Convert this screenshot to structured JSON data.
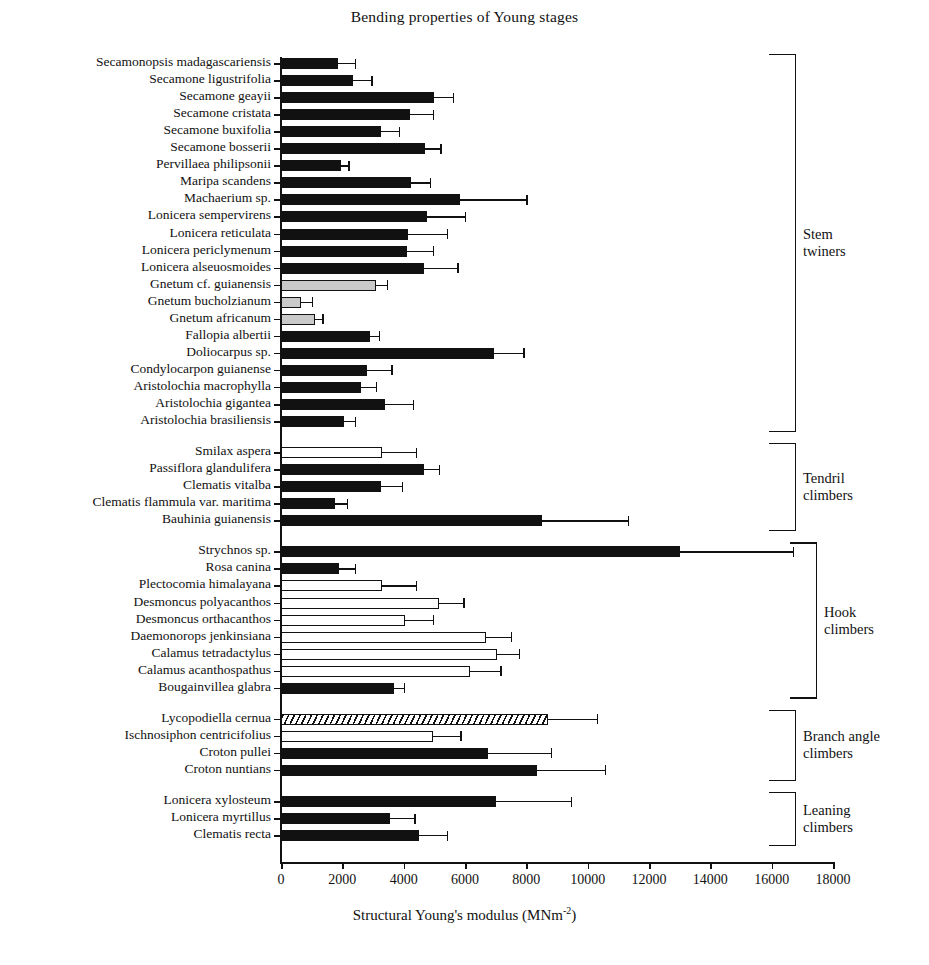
{
  "title": "Bending properties of Young stages",
  "axis": {
    "x_label_main": "Structural Young's modulus (MNm",
    "x_label_sup": "-2",
    "x_label_end": ")",
    "x_ticks": [
      "0",
      "2000",
      "4000",
      "6000",
      "8000",
      "10000",
      "12000",
      "14000",
      "16000",
      "18000"
    ]
  },
  "groups": [
    {
      "id": "stem-twiners",
      "label_lines": [
        "Stem",
        "twiners"
      ]
    },
    {
      "id": "tendril-climbers",
      "label_lines": [
        "Tendril",
        "climbers"
      ]
    },
    {
      "id": "hook-climbers",
      "label_lines": [
        "Hook",
        "climbers"
      ]
    },
    {
      "id": "branch-angle-climbers",
      "label_lines": [
        "Branch angle",
        "climbers"
      ]
    },
    {
      "id": "leaning-climbers",
      "label_lines": [
        "Leaning",
        "climbers"
      ]
    }
  ],
  "chart_data": {
    "type": "bar",
    "orientation": "horizontal",
    "title": "Bending properties of Young stages",
    "xlabel": "Structural Young's modulus (MNm-2)",
    "ylabel": "",
    "xlim": [
      0,
      18000
    ],
    "xticks": [
      0,
      2000,
      4000,
      6000,
      8000,
      10000,
      12000,
      14000,
      16000,
      18000
    ],
    "grid": false,
    "legend": "none",
    "error_bars": "upper standard deviation",
    "fill_styles": {
      "solid": "black",
      "open": "white",
      "gray": "grey",
      "hatch": "diagonal hatched"
    },
    "categories": [
      "Secamonopsis madagascariensis",
      "Secamone ligustrifolia",
      "Secamone geayii",
      "Secamone cristata",
      "Secamone buxifolia",
      "Secamone bosserii",
      "Pervillaea philipsonii",
      "Maripa scandens",
      "Machaerium sp.",
      "Lonicera sempervirens",
      "Lonicera reticulata",
      "Lonicera periclymenum",
      "Lonicera alseuosmoides",
      "Gnetum cf. guianensis",
      "Gnetum bucholzianum",
      "Gnetum africanum",
      "Fallopia albertii",
      "Doliocarpus sp.",
      "Condylocarpon guianense",
      "Aristolochia macrophylla",
      "Aristolochia gigantea",
      "Aristolochia brasiliensis",
      "Smilax aspera",
      "Passiflora glandulifera",
      "Clematis vitalba",
      "Clematis flammula var. maritima",
      "Bauhinia guianensis",
      "Strychnos sp.",
      "Rosa canina",
      "Plectocomia himalayana",
      "Desmoncus polyacanthos",
      "Desmoncus orthacanthos",
      "Daemonorops jenkinsiana",
      "Calamus tetradactylus",
      "Calamus acanthospathus",
      "Bougainvillea glabra",
      "Lycopodiella cernua",
      "Ischnosiphon centricifolius",
      "Croton pullei",
      "Croton nuntians",
      "Lonicera xylosteum",
      "Lonicera myrtillus",
      "Clematis recta"
    ],
    "values": [
      1850,
      2350,
      5000,
      4200,
      3250,
      4700,
      1950,
      4250,
      5850,
      4750,
      4150,
      4100,
      4650,
      3100,
      650,
      1100,
      2900,
      6950,
      2800,
      2600,
      3400,
      2050,
      3300,
      4650,
      3250,
      1750,
      8500,
      13000,
      1900,
      3300,
      5150,
      4050,
      6700,
      7050,
      6150,
      3700,
      8700,
      4950,
      6750,
      8350,
      7000,
      3550,
      4500
    ],
    "errors_upper": [
      2400,
      2950,
      5600,
      4950,
      3850,
      5200,
      2200,
      4850,
      8000,
      6000,
      5400,
      4950,
      5750,
      3450,
      1000,
      1350,
      3200,
      7900,
      3600,
      3100,
      4300,
      2400,
      4400,
      5150,
      3950,
      2150,
      11300,
      16700,
      2400,
      4400,
      5950,
      4950,
      7500,
      7750,
      7150,
      4000,
      10300,
      5850,
      8800,
      10550,
      9450,
      4350,
      5400
    ],
    "fill": [
      "solid",
      "solid",
      "solid",
      "solid",
      "solid",
      "solid",
      "solid",
      "solid",
      "solid",
      "solid",
      "solid",
      "solid",
      "solid",
      "gray",
      "gray",
      "gray",
      "solid",
      "solid",
      "solid",
      "solid",
      "solid",
      "solid",
      "open",
      "solid",
      "solid",
      "solid",
      "solid",
      "solid",
      "solid",
      "open",
      "open",
      "open",
      "open",
      "open",
      "open",
      "solid",
      "hatch",
      "open",
      "solid",
      "solid",
      "solid",
      "solid",
      "solid"
    ],
    "group_of": [
      "stem-twiners",
      "stem-twiners",
      "stem-twiners",
      "stem-twiners",
      "stem-twiners",
      "stem-twiners",
      "stem-twiners",
      "stem-twiners",
      "stem-twiners",
      "stem-twiners",
      "stem-twiners",
      "stem-twiners",
      "stem-twiners",
      "stem-twiners",
      "stem-twiners",
      "stem-twiners",
      "stem-twiners",
      "stem-twiners",
      "stem-twiners",
      "stem-twiners",
      "stem-twiners",
      "stem-twiners",
      "tendril-climbers",
      "tendril-climbers",
      "tendril-climbers",
      "tendril-climbers",
      "tendril-climbers",
      "hook-climbers",
      "hook-climbers",
      "hook-climbers",
      "hook-climbers",
      "hook-climbers",
      "hook-climbers",
      "hook-climbers",
      "hook-climbers",
      "hook-climbers",
      "branch-angle-climbers",
      "branch-angle-climbers",
      "branch-angle-climbers",
      "branch-angle-climbers",
      "leaning-climbers",
      "leaning-climbers",
      "leaning-climbers"
    ]
  }
}
